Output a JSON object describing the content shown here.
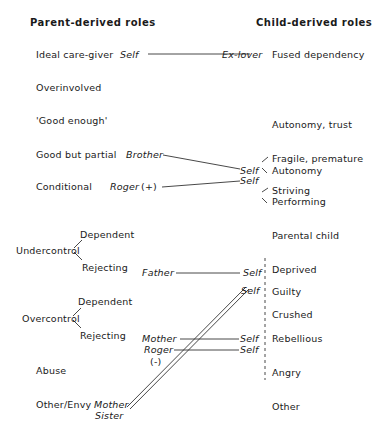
{
  "headers": {
    "left": "Parent-derived roles",
    "right": "Child-derived roles"
  },
  "parent_roles": [
    {
      "label": "Ideal care-giver"
    },
    {
      "label": "Overinvolved"
    },
    {
      "label": "'Good enough'"
    },
    {
      "label": "Good but partial"
    },
    {
      "label": "Conditional"
    },
    {
      "label": "Undercontrol",
      "branches": [
        "Dependent",
        "Rejecting"
      ]
    },
    {
      "label": "Overcontrol",
      "branches": [
        "Dependent",
        "Rejecting"
      ]
    },
    {
      "label": "Abuse"
    },
    {
      "label": "Other/Envy"
    }
  ],
  "child_roles": [
    {
      "label": "Fused dependency"
    },
    {
      "label": "Autonomy, trust"
    },
    {
      "label": "Fragile, premature"
    },
    {
      "label": "Autonomy"
    },
    {
      "label": "Striving"
    },
    {
      "label": "Performing"
    },
    {
      "label": "Parental child"
    },
    {
      "label": "Deprived"
    },
    {
      "label": "Guilty"
    },
    {
      "label": "Crushed"
    },
    {
      "label": "Rebellious"
    },
    {
      "label": "Angry"
    },
    {
      "label": "Other"
    }
  ],
  "persons_left": {
    "self_top": "Self",
    "brother": "Brother",
    "roger_plus": "Roger",
    "roger_plus_sign": "(+)",
    "father": "Father",
    "mother_mid": "Mother",
    "roger_minus": "Roger",
    "roger_minus_sign": "(-)",
    "mother_bottom": "Mother",
    "sister": "Sister"
  },
  "persons_right": {
    "ex_lover": "Ex-lover",
    "self_good_partial": "Self",
    "self_conditional": "Self",
    "self_father": "Self",
    "self_guilty": "Self",
    "self_mother": "Self",
    "self_roger": "Self"
  },
  "connections": [
    {
      "from": "Self",
      "to": "Ex-lover",
      "style": "single"
    },
    {
      "from": "Brother",
      "to": "Self",
      "style": "single"
    },
    {
      "from": "Roger (+)",
      "to": "Self",
      "style": "single"
    },
    {
      "from": "Father",
      "to": "Self",
      "style": "single"
    },
    {
      "from": "Mother",
      "to": "Self",
      "style": "single"
    },
    {
      "from": "Roger (-)",
      "to": "Self",
      "style": "single"
    },
    {
      "from": "Mother/Sister",
      "to": "Self (Guilty)",
      "style": "double"
    }
  ]
}
